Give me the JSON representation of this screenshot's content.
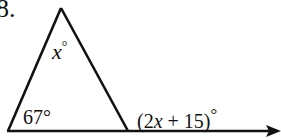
{
  "problem": {
    "number": "8.",
    "angle_apex": {
      "variable": "x",
      "unit": "°"
    },
    "angle_base_left": "67°",
    "exterior_angle": {
      "open": "(2",
      "variable": "x",
      "rest": " + 15)",
      "unit": "°"
    }
  },
  "figure": {
    "type": "triangle with extended base (exterior angle)",
    "apex": [
      61,
      8
    ],
    "base_left": [
      8,
      131
    ],
    "base_right": [
      128,
      131
    ],
    "ray_end": [
      279,
      131
    ],
    "stroke_color": "#111111"
  }
}
